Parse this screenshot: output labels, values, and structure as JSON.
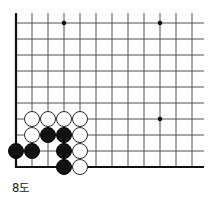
{
  "figure": {
    "caption": "8도",
    "kind": "go-board-corner-diagram"
  },
  "board": {
    "background_color": "#ffffff",
    "line_color": "#3c3c3c",
    "edge_line_color": "#111111",
    "origin_x": 16,
    "origin_y": 23,
    "cell": 16,
    "columns": 12,
    "rows": 10,
    "edge_left": true,
    "edge_bottom": true,
    "star_point_color": "#111111",
    "star_points": [
      {
        "col": 3,
        "row": 0
      },
      {
        "col": 9,
        "row": 0
      },
      {
        "col": 9,
        "row": 6
      }
    ]
  },
  "stones": {
    "black_color": "#111111",
    "white_color": "#ffffff",
    "white_border_color": "#2a2a2a",
    "radius": 8.2,
    "list": [
      {
        "col": 1,
        "row": 6,
        "color": "white"
      },
      {
        "col": 2,
        "row": 6,
        "color": "white"
      },
      {
        "col": 3,
        "row": 6,
        "color": "white"
      },
      {
        "col": 4,
        "row": 6,
        "color": "white"
      },
      {
        "col": 1,
        "row": 7,
        "color": "white"
      },
      {
        "col": 2,
        "row": 7,
        "color": "black"
      },
      {
        "col": 3,
        "row": 7,
        "color": "black"
      },
      {
        "col": 4,
        "row": 7,
        "color": "white"
      },
      {
        "col": 0,
        "row": 8,
        "color": "black"
      },
      {
        "col": 1,
        "row": 8,
        "color": "black"
      },
      {
        "col": 3,
        "row": 8,
        "color": "black"
      },
      {
        "col": 4,
        "row": 8,
        "color": "white"
      },
      {
        "col": 3,
        "row": 9,
        "color": "black"
      },
      {
        "col": 4,
        "row": 9,
        "color": "white"
      }
    ]
  }
}
